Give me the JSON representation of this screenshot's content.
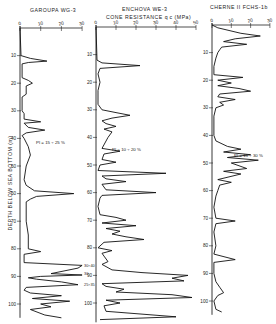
{
  "chart_data": {
    "type": "line",
    "shared_xlabel": "CONE RESISTANCE q_c (MPa)",
    "ylabel": "DEPTH BELOW SEA BOTTOM (m)",
    "y_ticks": [
      10,
      20,
      30,
      40,
      50,
      60,
      70,
      80,
      90,
      100
    ],
    "y_inverted": true,
    "grid": false,
    "legend": "none",
    "panels": [
      {
        "name": "GAROUPA WG-3",
        "xlim": [
          0,
          30
        ],
        "x_ticks": [
          0,
          10,
          20,
          30
        ],
        "ylim": [
          0,
          105
        ],
        "annotation": "PI = 15 ÷ 25 %",
        "annotation_depth": 42,
        "side_labels": [
          {
            "depth": 86,
            "text": "30÷40"
          },
          {
            "depth": 89,
            "text": "30"
          },
          {
            "depth": 93,
            "text": "25÷35"
          }
        ],
        "profile": [
          [
            0,
            0
          ],
          [
            0.5,
            10
          ],
          [
            5,
            11
          ],
          [
            13,
            12
          ],
          [
            4,
            12.5
          ],
          [
            1,
            13
          ],
          [
            1,
            18
          ],
          [
            4,
            19
          ],
          [
            6,
            20
          ],
          [
            3,
            21
          ],
          [
            3,
            24
          ],
          [
            1,
            25
          ],
          [
            1,
            30
          ],
          [
            2,
            31
          ],
          [
            2,
            33
          ],
          [
            10,
            34
          ],
          [
            2,
            34.5
          ],
          [
            4,
            36
          ],
          [
            12,
            37
          ],
          [
            3,
            38
          ],
          [
            1,
            39
          ],
          [
            2,
            40
          ],
          [
            4,
            43
          ],
          [
            5,
            46
          ],
          [
            3,
            50
          ],
          [
            2,
            55
          ],
          [
            3,
            57
          ],
          [
            7,
            59
          ],
          [
            26,
            60
          ],
          [
            8,
            61
          ],
          [
            5,
            62
          ],
          [
            3,
            63
          ],
          [
            3,
            70
          ],
          [
            4,
            75
          ],
          [
            4,
            80
          ],
          [
            10,
            81
          ],
          [
            2,
            82
          ],
          [
            2,
            85
          ],
          [
            30,
            86
          ],
          [
            28,
            87
          ],
          [
            15,
            89
          ],
          [
            30,
            89.5
          ],
          [
            10,
            90
          ],
          [
            4,
            90.5
          ],
          [
            8,
            91
          ],
          [
            20,
            92
          ],
          [
            28,
            93
          ],
          [
            3,
            94
          ],
          [
            2,
            95
          ],
          [
            5,
            96
          ],
          [
            20,
            97
          ],
          [
            6,
            98
          ],
          [
            24,
            99
          ],
          [
            10,
            100
          ],
          [
            15,
            101
          ],
          [
            5,
            102
          ],
          [
            12,
            104
          ],
          [
            20,
            105
          ]
        ]
      },
      {
        "name": "ENCHOVA WE-3",
        "xlim": [
          0,
          50
        ],
        "x_ticks": [
          0,
          10,
          20,
          30,
          40,
          50
        ],
        "ylim": [
          0,
          107
        ],
        "annotation": "PI = 10 ÷ 20 %",
        "annotation_depth": 45,
        "profile": [
          [
            0,
            0
          ],
          [
            0.5,
            12
          ],
          [
            3,
            13
          ],
          [
            22,
            14
          ],
          [
            2,
            15
          ],
          [
            1,
            17
          ],
          [
            2,
            20
          ],
          [
            1,
            23
          ],
          [
            1,
            28
          ],
          [
            3,
            30
          ],
          [
            10,
            31
          ],
          [
            17,
            32
          ],
          [
            8,
            33
          ],
          [
            3,
            34
          ],
          [
            5,
            35
          ],
          [
            10,
            36
          ],
          [
            4,
            37
          ],
          [
            8,
            38
          ],
          [
            6,
            40
          ],
          [
            3,
            44
          ],
          [
            12,
            45
          ],
          [
            4,
            46
          ],
          [
            3,
            48
          ],
          [
            10,
            49
          ],
          [
            2,
            50
          ],
          [
            1,
            52
          ],
          [
            35,
            53
          ],
          [
            3,
            54
          ],
          [
            5,
            55
          ],
          [
            15,
            56
          ],
          [
            3,
            57
          ],
          [
            5,
            59
          ],
          [
            30,
            60
          ],
          [
            3,
            61
          ],
          [
            2,
            62
          ],
          [
            1,
            65
          ],
          [
            2,
            68
          ],
          [
            10,
            69
          ],
          [
            15,
            70
          ],
          [
            3,
            71
          ],
          [
            20,
            72
          ],
          [
            5,
            73
          ],
          [
            12,
            74
          ],
          [
            8,
            75
          ],
          [
            15,
            76
          ],
          [
            24,
            77
          ],
          [
            4,
            78
          ],
          [
            1,
            80
          ],
          [
            8,
            81
          ],
          [
            3,
            82
          ],
          [
            4,
            83
          ],
          [
            6,
            85
          ],
          [
            3,
            86
          ],
          [
            8,
            88
          ],
          [
            23,
            89
          ],
          [
            46,
            90
          ],
          [
            38,
            91
          ],
          [
            44,
            92
          ],
          [
            3,
            93
          ],
          [
            5,
            94
          ],
          [
            14,
            95
          ],
          [
            10,
            96
          ],
          [
            38,
            97
          ],
          [
            48,
            98
          ],
          [
            5,
            99
          ],
          [
            12,
            100
          ],
          [
            4,
            101
          ],
          [
            5,
            103
          ],
          [
            40,
            105
          ],
          [
            2,
            106
          ]
        ]
      },
      {
        "name": "CHERNE II FCHS-1b",
        "xlim": [
          0,
          30
        ],
        "x_ticks": [
          0,
          10,
          20,
          30
        ],
        "ylim": [
          0,
          105
        ],
        "annotation": "PI = 15 ÷ 30 %",
        "annotation_depth": 48,
        "profile": [
          [
            0,
            0
          ],
          [
            3,
            1
          ],
          [
            15,
            3
          ],
          [
            25,
            4
          ],
          [
            12,
            5
          ],
          [
            6,
            6
          ],
          [
            18,
            7
          ],
          [
            5,
            8
          ],
          [
            4,
            9
          ],
          [
            3,
            10
          ],
          [
            2,
            12
          ],
          [
            1,
            15
          ],
          [
            1,
            18
          ],
          [
            16,
            19
          ],
          [
            3,
            20
          ],
          [
            10,
            21
          ],
          [
            3,
            22
          ],
          [
            14,
            23
          ],
          [
            20,
            24
          ],
          [
            4,
            25
          ],
          [
            3,
            26
          ],
          [
            12,
            27
          ],
          [
            4,
            28
          ],
          [
            6,
            29
          ],
          [
            2,
            30
          ],
          [
            1,
            33
          ],
          [
            1,
            40
          ],
          [
            2,
            42
          ],
          [
            8,
            44
          ],
          [
            15,
            45
          ],
          [
            6,
            46
          ],
          [
            20,
            47
          ],
          [
            8,
            48
          ],
          [
            24,
            49
          ],
          [
            10,
            50
          ],
          [
            18,
            52
          ],
          [
            6,
            53
          ],
          [
            15,
            54
          ],
          [
            3,
            56
          ],
          [
            10,
            57
          ],
          [
            4,
            58
          ],
          [
            3,
            60
          ],
          [
            2,
            62
          ],
          [
            1,
            66
          ],
          [
            2,
            70
          ],
          [
            12,
            71
          ],
          [
            2,
            72
          ],
          [
            1,
            75
          ],
          [
            2,
            80
          ],
          [
            1,
            83
          ],
          [
            12,
            85
          ],
          [
            1,
            86
          ],
          [
            1,
            90
          ],
          [
            2,
            93
          ],
          [
            4,
            95
          ],
          [
            6,
            97
          ],
          [
            3,
            98
          ],
          [
            1,
            100
          ],
          [
            2,
            103
          ],
          [
            5,
            104
          ]
        ]
      }
    ]
  },
  "labels": {
    "title_left": "GAROUPA  WG-3",
    "title_mid": "ENCHOVA  WE-3",
    "title_right": "CHERNE  II  FCHS-1b",
    "xaxis_title": "CONE  RESISTANCE  q c  (MPa)",
    "yaxis_title": "DEPTH  BELOW  SEA  BOTTOM  (m)"
  }
}
